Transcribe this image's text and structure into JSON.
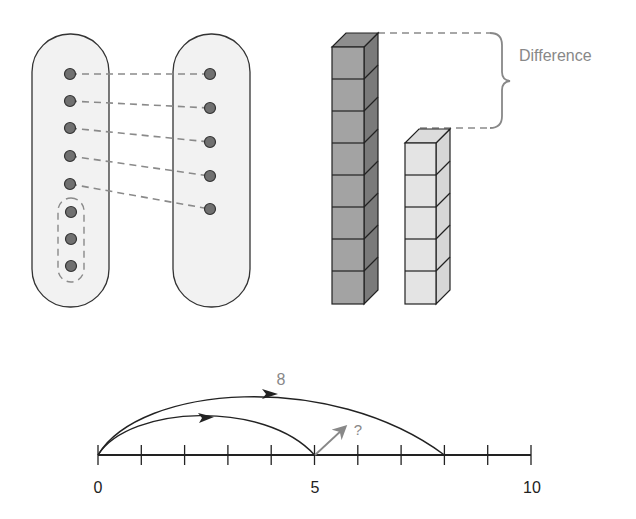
{
  "matching_diagram": {
    "left_set": {
      "dot_count": 8,
      "dot_ys": [
        74,
        101,
        128,
        156,
        184,
        212,
        239,
        266
      ]
    },
    "right_set": {
      "dot_count": 5,
      "dot_ys": [
        74,
        108,
        142,
        176,
        209
      ]
    },
    "unmatched_group": {
      "dot_count": 3
    }
  },
  "cube_towers": {
    "tall_tower": {
      "cube_count": 8,
      "color": "#a3a3a3"
    },
    "short_tower": {
      "cube_count": 5,
      "color": "#e4e4e4"
    },
    "difference_label": "Difference"
  },
  "number_line": {
    "min": 0,
    "max": 10,
    "tick_labels": [
      "0",
      "5",
      "10"
    ],
    "big_jump_label": "8",
    "big_jump_end": 8,
    "small_jump_end": 5,
    "unknown_label": "?"
  },
  "colors": {
    "dot_fill": "#707070",
    "oval_fill": "#f2f2f2",
    "stroke": "#333333",
    "dash": "#8a8a8a",
    "label_gray": "#888888"
  }
}
